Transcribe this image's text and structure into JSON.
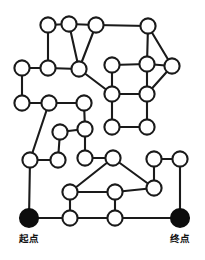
{
  "figure": {
    "name": "maze-graph-diagram",
    "type": "undirected-node-link-graph",
    "background_color": "#ffffff",
    "edge_color": "#1a1a1a",
    "open_node_fill": "#ffffff",
    "open_node_stroke": "#1a1a1a",
    "filled_node_color": "#0d0d0d",
    "node_radius": 7.6,
    "edge_width": 2.1
  },
  "labels": {
    "start": "起点",
    "end": "终点"
  },
  "nodes": [
    {
      "id": "n1",
      "x": 48,
      "y": 25,
      "style": "open"
    },
    {
      "id": "n2",
      "x": 69,
      "y": 24,
      "style": "open"
    },
    {
      "id": "n3",
      "x": 96,
      "y": 25,
      "style": "open"
    },
    {
      "id": "n4",
      "x": 148,
      "y": 26,
      "style": "open"
    },
    {
      "id": "n5",
      "x": 22,
      "y": 68,
      "style": "open"
    },
    {
      "id": "n6",
      "x": 48,
      "y": 68,
      "style": "open"
    },
    {
      "id": "n7",
      "x": 79,
      "y": 69,
      "style": "open"
    },
    {
      "id": "n8",
      "x": 112,
      "y": 65,
      "style": "open"
    },
    {
      "id": "n9",
      "x": 147,
      "y": 64,
      "style": "open"
    },
    {
      "id": "n10",
      "x": 172,
      "y": 66,
      "style": "open"
    },
    {
      "id": "n11",
      "x": 112,
      "y": 94,
      "style": "open"
    },
    {
      "id": "n12",
      "x": 147,
      "y": 94,
      "style": "open"
    },
    {
      "id": "n13",
      "x": 22,
      "y": 103,
      "style": "open"
    },
    {
      "id": "n14",
      "x": 49,
      "y": 103,
      "style": "open"
    },
    {
      "id": "n15",
      "x": 84,
      "y": 103,
      "style": "open"
    },
    {
      "id": "n16",
      "x": 112,
      "y": 127,
      "style": "open"
    },
    {
      "id": "n17",
      "x": 147,
      "y": 127,
      "style": "open"
    },
    {
      "id": "n18",
      "x": 60,
      "y": 132,
      "style": "open"
    },
    {
      "id": "n19",
      "x": 85,
      "y": 129,
      "style": "open"
    },
    {
      "id": "n20",
      "x": 30,
      "y": 160,
      "style": "open"
    },
    {
      "id": "n21",
      "x": 58,
      "y": 160,
      "style": "open"
    },
    {
      "id": "n22",
      "x": 85,
      "y": 158,
      "style": "open"
    },
    {
      "id": "n23",
      "x": 113,
      "y": 158,
      "style": "open"
    },
    {
      "id": "n24",
      "x": 154,
      "y": 159,
      "style": "open"
    },
    {
      "id": "n25",
      "x": 180,
      "y": 159,
      "style": "open"
    },
    {
      "id": "n26",
      "x": 154,
      "y": 188,
      "style": "open"
    },
    {
      "id": "n27",
      "x": 70,
      "y": 192,
      "style": "open"
    },
    {
      "id": "n28",
      "x": 115,
      "y": 192,
      "style": "open"
    },
    {
      "id": "n29",
      "x": 29,
      "y": 218,
      "style": "filled",
      "label": "start"
    },
    {
      "id": "n30",
      "x": 70,
      "y": 218,
      "style": "open"
    },
    {
      "id": "n31",
      "x": 115,
      "y": 218,
      "style": "open"
    },
    {
      "id": "n32",
      "x": 180,
      "y": 218,
      "style": "filled",
      "label": "end"
    }
  ],
  "edges": [
    [
      "n1",
      "n2"
    ],
    [
      "n2",
      "n3"
    ],
    [
      "n3",
      "n4"
    ],
    [
      "n1",
      "n6"
    ],
    [
      "n2",
      "n7"
    ],
    [
      "n3",
      "n7"
    ],
    [
      "n5",
      "n6"
    ],
    [
      "n6",
      "n7"
    ],
    [
      "n4",
      "n9"
    ],
    [
      "n4",
      "n10"
    ],
    [
      "n8",
      "n9"
    ],
    [
      "n9",
      "n10"
    ],
    [
      "n7",
      "n11"
    ],
    [
      "n8",
      "n11"
    ],
    [
      "n11",
      "n12"
    ],
    [
      "n9",
      "n12"
    ],
    [
      "n10",
      "n12"
    ],
    [
      "n5",
      "n13"
    ],
    [
      "n13",
      "n14"
    ],
    [
      "n14",
      "n15"
    ],
    [
      "n11",
      "n16"
    ],
    [
      "n12",
      "n17"
    ],
    [
      "n16",
      "n17"
    ],
    [
      "n15",
      "n19"
    ],
    [
      "n18",
      "n19"
    ],
    [
      "n18",
      "n21"
    ],
    [
      "n19",
      "n22"
    ],
    [
      "n14",
      "n20"
    ],
    [
      "n20",
      "n21"
    ],
    [
      "n22",
      "n23"
    ],
    [
      "n23",
      "n26"
    ],
    [
      "n23",
      "n27"
    ],
    [
      "n24",
      "n25"
    ],
    [
      "n24",
      "n26"
    ],
    [
      "n26",
      "n28"
    ],
    [
      "n27",
      "n28"
    ],
    [
      "n27",
      "n30"
    ],
    [
      "n28",
      "n31"
    ],
    [
      "n20",
      "n29"
    ],
    [
      "n29",
      "n30"
    ],
    [
      "n30",
      "n31"
    ],
    [
      "n31",
      "n32"
    ],
    [
      "n25",
      "n32"
    ]
  ]
}
